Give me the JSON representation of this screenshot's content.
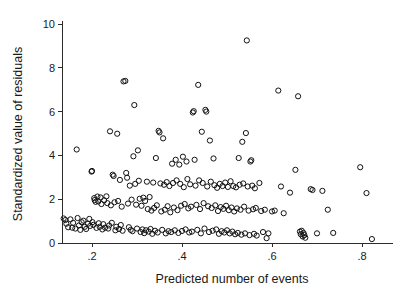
{
  "chart_data": {
    "type": "scatter",
    "title": "",
    "subtitle": "",
    "xlabel": "Predicted number of events",
    "ylabel": "Standardized value of residuals",
    "xlim": [
      0.12,
      0.845
    ],
    "ylim": [
      0,
      10
    ],
    "xticks": [
      0.2,
      0.4,
      0.6,
      0.8
    ],
    "xticklabels": [
      ".2",
      ".4",
      ".6",
      ".8"
    ],
    "yticks": [
      0,
      2,
      4,
      6,
      8,
      10
    ],
    "yticklabels": [
      "0",
      "2",
      "4",
      "6",
      "8",
      "10"
    ],
    "grid": false,
    "legend": null,
    "marker": {
      "shape": "circle-open",
      "radius_px": 2.6,
      "stroke": "#111111",
      "stroke_width": 1,
      "fill": "none"
    },
    "series": [
      {
        "name": "residuals",
        "points": [
          [
            0.137,
            1.12
          ],
          [
            0.141,
            1.05
          ],
          [
            0.143,
            0.88
          ],
          [
            0.147,
            0.72
          ],
          [
            0.152,
            1.08
          ],
          [
            0.156,
            0.7
          ],
          [
            0.158,
            0.92
          ],
          [
            0.163,
            0.66
          ],
          [
            0.166,
            4.27
          ],
          [
            0.168,
            1.14
          ],
          [
            0.171,
            0.8
          ],
          [
            0.174,
            0.6
          ],
          [
            0.177,
            0.95
          ],
          [
            0.181,
            1.02
          ],
          [
            0.184,
            0.74
          ],
          [
            0.187,
            0.64
          ],
          [
            0.191,
            0.88
          ],
          [
            0.194,
            1.1
          ],
          [
            0.196,
            0.78
          ],
          [
            0.199,
            3.26
          ],
          [
            0.2,
            3.29
          ],
          [
            0.201,
            0.95
          ],
          [
            0.203,
            0.83
          ],
          [
            0.205,
            2.05
          ],
          [
            0.206,
            1.96
          ],
          [
            0.208,
            1.88
          ],
          [
            0.21,
            0.69
          ],
          [
            0.212,
            2.12
          ],
          [
            0.214,
            1.9
          ],
          [
            0.215,
            0.9
          ],
          [
            0.217,
            0.74
          ],
          [
            0.219,
            2.08
          ],
          [
            0.221,
            1.78
          ],
          [
            0.223,
            0.62
          ],
          [
            0.225,
            0.86
          ],
          [
            0.227,
            1.95
          ],
          [
            0.229,
            0.7
          ],
          [
            0.232,
            2.13
          ],
          [
            0.234,
            1.82
          ],
          [
            0.236,
            0.66
          ],
          [
            0.238,
            0.8
          ],
          [
            0.24,
            5.1
          ],
          [
            0.242,
            1.72
          ],
          [
            0.244,
            0.92
          ],
          [
            0.246,
            3.12
          ],
          [
            0.248,
            3.06
          ],
          [
            0.25,
            1.86
          ],
          [
            0.252,
            0.58
          ],
          [
            0.254,
            0.74
          ],
          [
            0.256,
            4.99
          ],
          [
            0.258,
            1.92
          ],
          [
            0.26,
            0.64
          ],
          [
            0.262,
            2.88
          ],
          [
            0.264,
            0.82
          ],
          [
            0.266,
            1.66
          ],
          [
            0.268,
            0.56
          ],
          [
            0.27,
            7.38
          ],
          [
            0.274,
            7.4
          ],
          [
            0.276,
            3.2
          ],
          [
            0.278,
            2.98
          ],
          [
            0.28,
            1.8
          ],
          [
            0.282,
            0.72
          ],
          [
            0.284,
            2.62
          ],
          [
            0.286,
            0.6
          ],
          [
            0.288,
            1.98
          ],
          [
            0.29,
            0.54
          ],
          [
            0.292,
            3.96
          ],
          [
            0.294,
            6.3
          ],
          [
            0.296,
            2.7
          ],
          [
            0.298,
            1.75
          ],
          [
            0.3,
            0.66
          ],
          [
            0.302,
            4.23
          ],
          [
            0.304,
            2.84
          ],
          [
            0.306,
            2.02
          ],
          [
            0.308,
            0.5
          ],
          [
            0.31,
            1.7
          ],
          [
            0.312,
            0.62
          ],
          [
            0.314,
            2.07
          ],
          [
            0.316,
            0.45
          ],
          [
            0.318,
            1.92
          ],
          [
            0.32,
            0.58
          ],
          [
            0.322,
            2.8
          ],
          [
            0.324,
            1.55
          ],
          [
            0.326,
            0.52
          ],
          [
            0.328,
            2.1
          ],
          [
            0.33,
            0.64
          ],
          [
            0.332,
            1.48
          ],
          [
            0.334,
            0.42
          ],
          [
            0.336,
            2.76
          ],
          [
            0.338,
            1.6
          ],
          [
            0.34,
            0.56
          ],
          [
            0.342,
            3.88
          ],
          [
            0.344,
            1.72
          ],
          [
            0.346,
            0.48
          ],
          [
            0.348,
            5.12
          ],
          [
            0.35,
            5.05
          ],
          [
            0.352,
            2.72
          ],
          [
            0.354,
            1.44
          ],
          [
            0.356,
            0.6
          ],
          [
            0.358,
            4.78
          ],
          [
            0.36,
            2.66
          ],
          [
            0.362,
            1.52
          ],
          [
            0.364,
            0.44
          ],
          [
            0.366,
            2.78
          ],
          [
            0.368,
            1.68
          ],
          [
            0.37,
            0.54
          ],
          [
            0.372,
            2.6
          ],
          [
            0.374,
            1.4
          ],
          [
            0.376,
            0.5
          ],
          [
            0.378,
            3.62
          ],
          [
            0.38,
            2.74
          ],
          [
            0.382,
            1.62
          ],
          [
            0.384,
            0.58
          ],
          [
            0.386,
            3.8
          ],
          [
            0.388,
            2.86
          ],
          [
            0.39,
            1.5
          ],
          [
            0.392,
            0.46
          ],
          [
            0.394,
            3.58
          ],
          [
            0.396,
            2.7
          ],
          [
            0.398,
            1.7
          ],
          [
            0.4,
            0.55
          ],
          [
            0.402,
            3.94
          ],
          [
            0.404,
            2.55
          ],
          [
            0.406,
            1.78
          ],
          [
            0.408,
            0.62
          ],
          [
            0.41,
            3.72
          ],
          [
            0.412,
            2.92
          ],
          [
            0.414,
            1.58
          ],
          [
            0.416,
            0.48
          ],
          [
            0.418,
            2.68
          ],
          [
            0.42,
            1.66
          ],
          [
            0.422,
            0.52
          ],
          [
            0.424,
            5.96
          ],
          [
            0.426,
            6.02
          ],
          [
            0.428,
            3.8
          ],
          [
            0.43,
            2.62
          ],
          [
            0.432,
            1.74
          ],
          [
            0.434,
            0.6
          ],
          [
            0.436,
            7.22
          ],
          [
            0.438,
            2.86
          ],
          [
            0.44,
            1.55
          ],
          [
            0.442,
            0.44
          ],
          [
            0.444,
            5.08
          ],
          [
            0.446,
            2.74
          ],
          [
            0.448,
            1.82
          ],
          [
            0.45,
            0.66
          ],
          [
            0.452,
            6.08
          ],
          [
            0.454,
            6.0
          ],
          [
            0.456,
            2.58
          ],
          [
            0.458,
            1.68
          ],
          [
            0.46,
            0.5
          ],
          [
            0.462,
            4.68
          ],
          [
            0.464,
            2.8
          ],
          [
            0.466,
            1.6
          ],
          [
            0.468,
            0.56
          ],
          [
            0.47,
            3.86
          ],
          [
            0.472,
            2.64
          ],
          [
            0.474,
            1.72
          ],
          [
            0.476,
            0.62
          ],
          [
            0.478,
            2.52
          ],
          [
            0.48,
            1.46
          ],
          [
            0.482,
            0.42
          ],
          [
            0.484,
            2.7
          ],
          [
            0.486,
            1.64
          ],
          [
            0.488,
            0.54
          ],
          [
            0.49,
            2.6
          ],
          [
            0.492,
            1.56
          ],
          [
            0.494,
            0.48
          ],
          [
            0.496,
            2.76
          ],
          [
            0.498,
            1.7
          ],
          [
            0.5,
            0.58
          ],
          [
            0.502,
            2.56
          ],
          [
            0.504,
            1.5
          ],
          [
            0.506,
            0.44
          ],
          [
            0.508,
            2.82
          ],
          [
            0.51,
            1.62
          ],
          [
            0.512,
            0.52
          ],
          [
            0.514,
            2.6
          ],
          [
            0.516,
            1.44
          ],
          [
            0.518,
            0.4
          ],
          [
            0.52,
            2.54
          ],
          [
            0.522,
            1.58
          ],
          [
            0.524,
            0.46
          ],
          [
            0.526,
            3.88
          ],
          [
            0.528,
            2.66
          ],
          [
            0.53,
            1.52
          ],
          [
            0.532,
            0.38
          ],
          [
            0.534,
            4.62
          ],
          [
            0.536,
            2.72
          ],
          [
            0.538,
            1.66
          ],
          [
            0.54,
            0.44
          ],
          [
            0.542,
            5.02
          ],
          [
            0.544,
            9.25
          ],
          [
            0.546,
            2.58
          ],
          [
            0.548,
            1.48
          ],
          [
            0.55,
            0.36
          ],
          [
            0.552,
            3.72
          ],
          [
            0.554,
            3.78
          ],
          [
            0.556,
            2.62
          ],
          [
            0.558,
            1.54
          ],
          [
            0.56,
            0.42
          ],
          [
            0.562,
            2.5
          ],
          [
            0.564,
            1.6
          ],
          [
            0.566,
            0.34
          ],
          [
            0.572,
            2.74
          ],
          [
            0.576,
            1.46
          ],
          [
            0.58,
            0.5
          ],
          [
            0.584,
            1.52
          ],
          [
            0.588,
            0.22
          ],
          [
            0.592,
            0.44
          ],
          [
            0.6,
            1.44
          ],
          [
            0.606,
            1.48
          ],
          [
            0.614,
            6.96
          ],
          [
            0.62,
            2.58
          ],
          [
            0.626,
            1.36
          ],
          [
            0.64,
            2.3
          ],
          [
            0.652,
            3.34
          ],
          [
            0.658,
            6.7
          ],
          [
            0.662,
            0.52
          ],
          [
            0.664,
            0.4
          ],
          [
            0.666,
            0.56
          ],
          [
            0.668,
            0.3
          ],
          [
            0.67,
            0.46
          ],
          [
            0.672,
            0.36
          ],
          [
            0.674,
            0.24
          ],
          [
            0.686,
            2.46
          ],
          [
            0.69,
            2.42
          ],
          [
            0.7,
            0.44
          ],
          [
            0.712,
            2.38
          ],
          [
            0.724,
            1.52
          ],
          [
            0.736,
            0.46
          ],
          [
            0.796,
            3.46
          ],
          [
            0.81,
            2.28
          ],
          [
            0.822,
            0.18
          ]
        ]
      }
    ]
  },
  "axes": {
    "x_axis_name": "Predicted number of events",
    "y_axis_name": "Standardized value of residuals"
  }
}
